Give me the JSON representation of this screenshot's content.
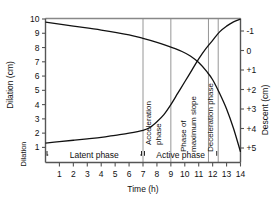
{
  "figure": {
    "background": "#ffffff",
    "line_color": "#111111",
    "divider_color": "#8a8a8a",
    "frame_color": "#555555"
  },
  "chart_data": {
    "type": "line",
    "title": "",
    "xlabel": "Time (h)",
    "x": [
      1,
      2,
      3,
      4,
      5,
      6,
      7,
      8,
      9,
      10,
      11,
      12,
      13,
      14
    ],
    "xlim": [
      0,
      14
    ],
    "xticks": [
      "1",
      "2",
      "3",
      "4",
      "5",
      "6",
      "7",
      "8",
      "9",
      "10",
      "11",
      "12",
      "13",
      "14"
    ],
    "grid": false,
    "legend": "none",
    "axes": [
      {
        "id": "left",
        "label": "Dilation (cm)",
        "secondary_label": "Dilation",
        "unit": "cm",
        "ticks": [
          "10",
          "9",
          "8",
          "7",
          "6",
          "5",
          "4",
          "3",
          "2",
          "1"
        ],
        "lim": [
          1,
          10
        ],
        "direction": "increasing-up"
      },
      {
        "id": "right",
        "label": "Descent (cm)",
        "unit": "cm",
        "ticks": [
          "-1",
          "0",
          "+1",
          "+2",
          "+3",
          "+4",
          "+5"
        ],
        "lim": [
          -1,
          5
        ],
        "direction": "increasing-down"
      }
    ],
    "series": [
      {
        "name": "Cervical dilation",
        "axis": "left",
        "shape": "sigmoid",
        "points": [
          {
            "x": 0.0,
            "y": 1.3
          },
          {
            "x": 1.0,
            "y": 1.4
          },
          {
            "x": 2.0,
            "y": 1.5
          },
          {
            "x": 3.0,
            "y": 1.6
          },
          {
            "x": 4.0,
            "y": 1.7
          },
          {
            "x": 5.0,
            "y": 1.85
          },
          {
            "x": 6.0,
            "y": 2.0
          },
          {
            "x": 7.0,
            "y": 2.2
          },
          {
            "x": 7.5,
            "y": 2.4
          },
          {
            "x": 8.0,
            "y": 2.8
          },
          {
            "x": 8.5,
            "y": 3.3
          },
          {
            "x": 9.0,
            "y": 4.0
          },
          {
            "x": 9.5,
            "y": 4.8
          },
          {
            "x": 10.0,
            "y": 5.6
          },
          {
            "x": 10.5,
            "y": 6.4
          },
          {
            "x": 11.0,
            "y": 7.2
          },
          {
            "x": 11.5,
            "y": 7.9
          },
          {
            "x": 12.0,
            "y": 8.5
          },
          {
            "x": 12.5,
            "y": 9.1
          },
          {
            "x": 13.0,
            "y": 9.5
          },
          {
            "x": 13.5,
            "y": 9.8
          },
          {
            "x": 14.0,
            "y": 10.0
          }
        ]
      },
      {
        "name": "Fetal descent",
        "axis": "right",
        "shape": "descending",
        "points": [
          {
            "x": 0.0,
            "y": -1.45
          },
          {
            "x": 2.0,
            "y": -1.25
          },
          {
            "x": 4.0,
            "y": -1.05
          },
          {
            "x": 6.0,
            "y": -0.8
          },
          {
            "x": 7.0,
            "y": -0.62
          },
          {
            "x": 8.0,
            "y": -0.42
          },
          {
            "x": 8.6,
            "y": -0.28
          },
          {
            "x": 9.2,
            "y": -0.12
          },
          {
            "x": 9.8,
            "y": 0.05
          },
          {
            "x": 10.4,
            "y": 0.28
          },
          {
            "x": 11.0,
            "y": 0.62
          },
          {
            "x": 11.6,
            "y": 1.1
          },
          {
            "x": 12.0,
            "y": 1.5
          },
          {
            "x": 12.5,
            "y": 2.2
          },
          {
            "x": 13.0,
            "y": 3.0
          },
          {
            "x": 13.5,
            "y": 4.0
          },
          {
            "x": 14.0,
            "y": 5.2
          }
        ]
      }
    ],
    "phase_dividers_x": [
      7.0,
      9.0,
      11.7,
      12.4
    ],
    "annotations": [
      {
        "id": "acceleration-phase",
        "text": "Acceleration phase",
        "orientation": "vertical",
        "x": 7.6
      },
      {
        "id": "phase-of-maximum-slope",
        "text": "Phase of maximum slope",
        "orientation": "vertical",
        "x": 10.1
      },
      {
        "id": "deceleration-phase",
        "text": "Deceleration phase",
        "orientation": "vertical",
        "x": 12.0
      }
    ],
    "brackets": [
      {
        "id": "latent-phase",
        "text": "Latent phase",
        "from": 0.0,
        "to": 7.0
      },
      {
        "id": "active-phase",
        "text": "Active phase",
        "from": 7.0,
        "to": 12.4
      }
    ]
  }
}
